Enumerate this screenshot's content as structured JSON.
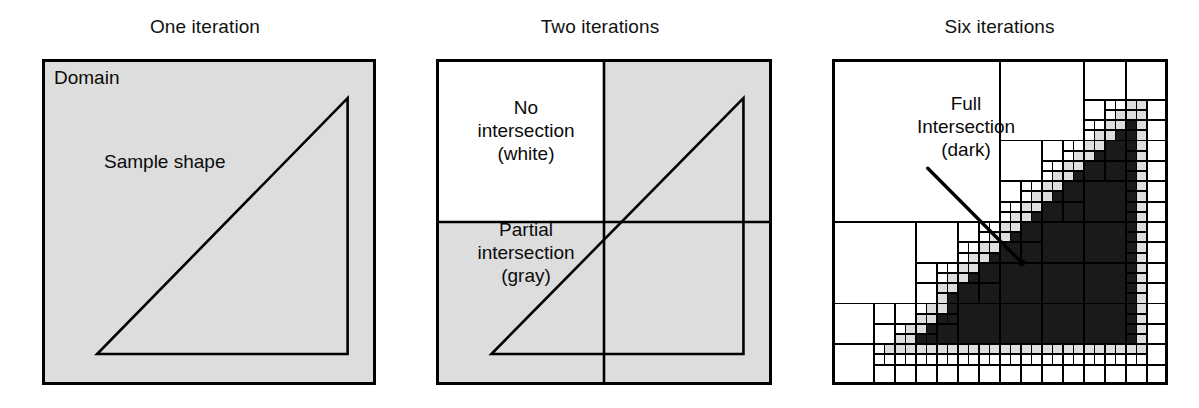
{
  "figure": {
    "width": 1199,
    "height": 408,
    "background": "#ffffff",
    "colors": {
      "white": "#ffffff",
      "gray": "#dddddd",
      "dark": "#1a1a1a",
      "line": "#000000",
      "text": "#0b0b0b"
    }
  },
  "panels": [
    {
      "id": "one",
      "title": "One iteration",
      "box": {
        "x": 0,
        "y": 0,
        "w": 334,
        "h": 326
      },
      "iterations": 1,
      "fill": "gray",
      "captions": [
        {
          "name": "domain-label",
          "text": "Domain",
          "align": "left"
        },
        {
          "name": "sample-shape-label",
          "text": "Sample shape",
          "align": "left"
        }
      ]
    },
    {
      "id": "two",
      "title": "Two iterations",
      "box": {
        "x": 0,
        "y": 0,
        "w": 336,
        "h": 326
      },
      "iterations": 2,
      "quadrants": [
        {
          "cell": "top-left",
          "state": "white"
        },
        {
          "cell": "top-right",
          "state": "gray"
        },
        {
          "cell": "bottom-left",
          "state": "gray"
        },
        {
          "cell": "bottom-right",
          "state": "gray"
        }
      ],
      "captions": [
        {
          "name": "no-intersection-label",
          "text": "No\nintersection\n(white)",
          "align": "center"
        },
        {
          "name": "partial-intersection-label",
          "text": "Partial\nintersection\n(gray)",
          "align": "center"
        }
      ]
    },
    {
      "id": "six",
      "title": "Six iterations",
      "box": {
        "x": 0,
        "y": 0,
        "w": 336,
        "h": 326
      },
      "iterations": 6,
      "captions": [
        {
          "name": "full-intersection-label",
          "text": "Full\nIntersection\n(dark)",
          "align": "center"
        }
      ],
      "leader_line": {
        "x1": 0.285,
        "y1": 0.335,
        "x2": 0.565,
        "y2": 0.625
      }
    }
  ],
  "shape": {
    "name": "right-triangle",
    "vertices_normalized": [
      {
        "x": 0.165,
        "y": 0.905
      },
      {
        "x": 0.915,
        "y": 0.905
      },
      {
        "x": 0.915,
        "y": 0.12
      }
    ]
  },
  "legend_states": {
    "white": "No intersection (white)",
    "gray": "Partial intersection (gray)",
    "dark": "Full Intersection (dark)"
  },
  "chart_data": {
    "type": "diagram",
    "subtitle": "",
    "panels": [
      "One iteration",
      "Two iterations",
      "Six iterations"
    ],
    "iteration_counts": [
      1,
      2,
      6
    ],
    "cell_states": [
      "white",
      "gray",
      "dark"
    ],
    "cell_state_meanings": [
      "No intersection (white)",
      "Partial intersection (gray)",
      "Full Intersection (dark)"
    ],
    "domain_label": "Domain",
    "shape_label": "Sample shape",
    "shape_type": "right triangle",
    "xlabel": "",
    "ylabel": ""
  }
}
